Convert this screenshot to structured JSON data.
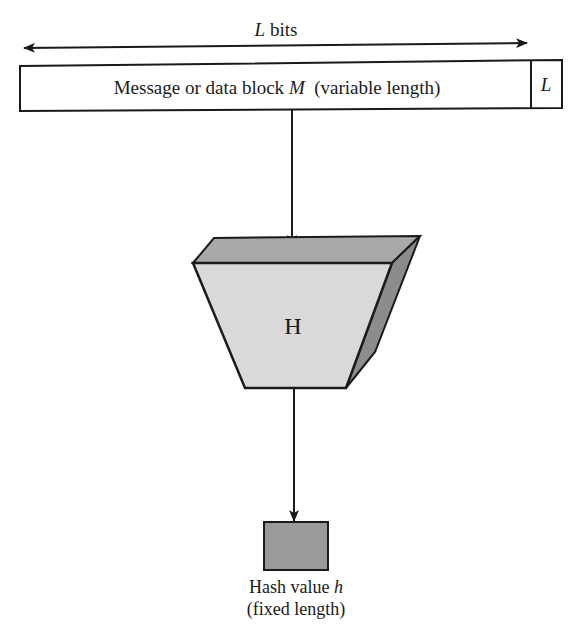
{
  "diagram": {
    "length_label": {
      "var": "L",
      "text": " bits"
    },
    "message_block": {
      "prefix": "Message or data block ",
      "var": "M",
      "suffix": "  (variable length)",
      "length_field": "L"
    },
    "hash_function": {
      "label": "H"
    },
    "output": {
      "line1_prefix": "Hash value ",
      "line1_var": "h",
      "line2": "(fixed length)"
    },
    "colors": {
      "stroke": "#1a1a1a",
      "front_face": "#d9d9d9",
      "top_face": "#a9a9a9",
      "side_face": "#8c8c8c",
      "hash_box": "#9a9a9a",
      "background": "#ffffff"
    }
  }
}
